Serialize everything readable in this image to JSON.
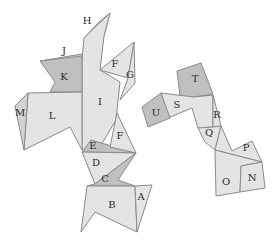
{
  "diagram": {
    "type": "polyhedron-net",
    "colors": {
      "light": "#e4e4e4",
      "mid": "#d2d2d2",
      "dark": "#c0c0c0",
      "edge": "#8a8a8a"
    },
    "net_left": {
      "faces": [
        {
          "id": "H",
          "label": "H",
          "label_x": 87,
          "label_y": 20,
          "points": "84,38 99,22 110,13 104,36",
          "shade": "light"
        },
        {
          "id": "I",
          "label": "I",
          "label_x": 100,
          "label_y": 101,
          "points": "84,38 110,13 104,36 100,70 120,82 116,120 101,145 82,150 82,60",
          "shade": "light"
        },
        {
          "id": "J",
          "label": "J",
          "label_x": 64,
          "label_y": 50,
          "points": "40,61 82,54 82,60",
          "shade": "mid"
        },
        {
          "id": "K",
          "label": "K",
          "label_x": 64,
          "label_y": 76,
          "points": "40,61 82,56 82,92 50,92 55,82",
          "shade": "dark"
        },
        {
          "id": "L",
          "label": "L",
          "label_x": 52,
          "label_y": 115,
          "points": "28,93 82,92 82,150 70,127 24,150",
          "shade": "light"
        },
        {
          "id": "M",
          "label": "M",
          "label_x": 20,
          "label_y": 112,
          "points": "28,93 15,106 24,150",
          "shade": "mid"
        },
        {
          "id": "F1",
          "label": "F",
          "label_x": 115,
          "label_y": 63,
          "points": "100,70 134,42 128,78",
          "shade": "light"
        },
        {
          "id": "G",
          "label": "G",
          "label_x": 130,
          "label_y": 74,
          "points": "134,42 135,83 120,100 128,78",
          "shade": "light"
        },
        {
          "id": "E",
          "label": "E",
          "label_x": 93,
          "label_y": 145,
          "points": "82,152 91,140 136,153",
          "shade": "dark"
        },
        {
          "id": "F2",
          "label": "F",
          "label_x": 120,
          "label_y": 135,
          "points": "117,113 136,153 110,147",
          "shade": "light"
        },
        {
          "id": "D",
          "label": "D",
          "label_x": 96,
          "label_y": 162,
          "points": "82,152 136,153 95,184",
          "shade": "light"
        },
        {
          "id": "C",
          "label": "C",
          "label_x": 105,
          "label_y": 178,
          "points": "95,184 136,153 118,180 135,186 87,186",
          "shade": "dark"
        },
        {
          "id": "B",
          "label": "B",
          "label_x": 112,
          "label_y": 204,
          "points": "87,186 135,186 137,232 95,212 81,232",
          "shade": "light"
        },
        {
          "id": "A",
          "label": "A",
          "label_x": 141,
          "label_y": 196,
          "points": "135,186 152,185 137,232",
          "shade": "light"
        }
      ]
    },
    "net_right": {
      "faces": [
        {
          "id": "T",
          "label": "T",
          "label_x": 195,
          "label_y": 78,
          "points": "177,71 201,63 213,94 194,97 180,96",
          "shade": "dark"
        },
        {
          "id": "S",
          "label": "S",
          "label_x": 177,
          "label_y": 104,
          "points": "161,93 194,97 213,95 213,127 198,128 192,108 168,118",
          "shade": "light"
        },
        {
          "id": "U",
          "label": "U",
          "label_x": 156,
          "label_y": 112,
          "points": "142,107 161,93 170,118 148,127",
          "shade": "dark"
        },
        {
          "id": "R",
          "label": "R",
          "label_x": 217,
          "label_y": 114,
          "points": "213,95 221,126 213,127",
          "shade": "light"
        },
        {
          "id": "Q",
          "label": "Q",
          "label_x": 209,
          "label_y": 132,
          "points": "198,128 213,127 221,126 215,150 205,142",
          "shade": "light"
        },
        {
          "id": "P",
          "label": "P",
          "label_x": 246,
          "label_y": 147,
          "points": "221,126 232,151 252,141 262,162 215,150",
          "shade": "light"
        },
        {
          "id": "O",
          "label": "O",
          "label_x": 226,
          "label_y": 181,
          "points": "215,150 262,162 241,166 240,192 216,196",
          "shade": "light"
        },
        {
          "id": "N",
          "label": "N",
          "label_x": 252,
          "label_y": 177,
          "points": "241,166 262,162 265,188 240,192",
          "shade": "light"
        }
      ]
    }
  }
}
